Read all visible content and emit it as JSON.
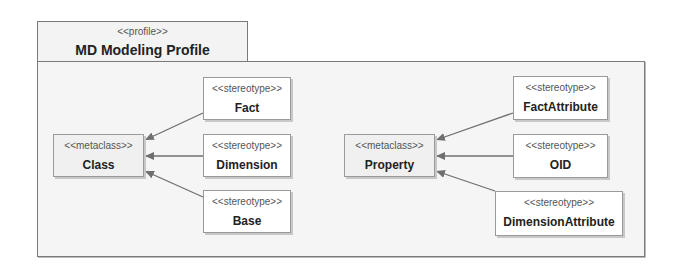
{
  "package": {
    "stereotype": "<<profile>>",
    "name": "MD Modeling Profile"
  },
  "metaclasses": [
    {
      "stereotype": "<<metaclass>>",
      "name": "Class"
    },
    {
      "stereotype": "<<metaclass>>",
      "name": "Property"
    }
  ],
  "stereotypes": [
    {
      "stereotype": "<<stereotype>>",
      "name": "Fact",
      "extends": "Class"
    },
    {
      "stereotype": "<<stereotype>>",
      "name": "Dimension",
      "extends": "Class"
    },
    {
      "stereotype": "<<stereotype>>",
      "name": "Base",
      "extends": "Class"
    },
    {
      "stereotype": "<<stereotype>>",
      "name": "FactAttribute",
      "extends": "Property"
    },
    {
      "stereotype": "<<stereotype>>",
      "name": "OID",
      "extends": "Property"
    },
    {
      "stereotype": "<<stereotype>>",
      "name": "DimensionAttribute",
      "extends": "Property"
    }
  ],
  "colors": {
    "line": "#6f6f6f",
    "border": "#7a7a7a",
    "package_fill": "#f5f5f5"
  }
}
